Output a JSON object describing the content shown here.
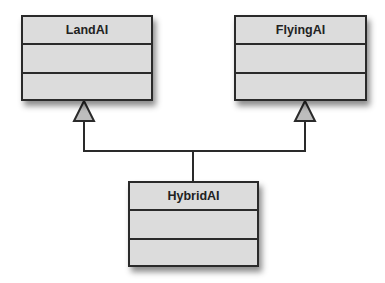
{
  "diagram": {
    "type": "uml-class-inheritance",
    "classes": [
      {
        "id": "land",
        "name": "LandAI",
        "attributes": [],
        "operations": []
      },
      {
        "id": "flying",
        "name": "FlyingAI",
        "attributes": [],
        "operations": []
      },
      {
        "id": "hybrid",
        "name": "HybridAI",
        "attributes": [],
        "operations": []
      }
    ],
    "relations": [
      {
        "from": "HybridAI",
        "to": "LandAI",
        "type": "generalization"
      },
      {
        "from": "HybridAI",
        "to": "FlyingAI",
        "type": "generalization"
      }
    ],
    "colors": {
      "box_fill": "#dcdcdc",
      "stroke": "#2a2a2a",
      "arrow_fill": "#bdbdbd"
    }
  }
}
